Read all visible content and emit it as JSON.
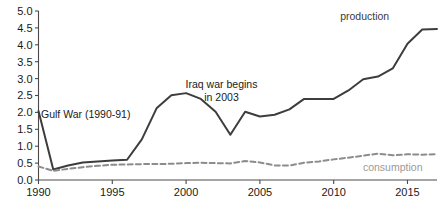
{
  "chart_data": {
    "type": "line",
    "title": "",
    "xlabel": "",
    "ylabel": "",
    "xlim": [
      1990,
      2017
    ],
    "ylim": [
      0.0,
      5.0
    ],
    "grid": false,
    "legend_position": "inline-labels",
    "x": [
      1990,
      1991,
      1992,
      1993,
      1994,
      1995,
      1996,
      1997,
      1998,
      1999,
      2000,
      2001,
      2002,
      2003,
      2004,
      2005,
      2006,
      2007,
      2008,
      2009,
      2010,
      2011,
      2012,
      2013,
      2014,
      2015,
      2016,
      2017
    ],
    "xtick_labels": [
      "1990",
      "1995",
      "2000",
      "2005",
      "2010",
      "2015"
    ],
    "xticks": [
      1990,
      1995,
      2000,
      2005,
      2010,
      2015
    ],
    "ytick_labels": [
      "0.0",
      "0.5",
      "1.0",
      "1.5",
      "2.0",
      "2.5",
      "3.0",
      "3.5",
      "4.0",
      "4.5",
      "5.0"
    ],
    "yticks": [
      0.0,
      0.5,
      1.0,
      1.5,
      2.0,
      2.5,
      3.0,
      3.5,
      4.0,
      4.5,
      5.0
    ],
    "series": [
      {
        "name": "production",
        "style": "solid",
        "color": "#3d3d3d",
        "label_x": 2012.1,
        "label_y": 4.72,
        "values": [
          2.04,
          0.31,
          0.43,
          0.52,
          0.55,
          0.58,
          0.6,
          1.2,
          2.12,
          2.51,
          2.57,
          2.4,
          2.02,
          1.34,
          2.02,
          1.88,
          1.93,
          2.09,
          2.4,
          2.4,
          2.4,
          2.65,
          2.98,
          3.06,
          3.3,
          4.03,
          4.45,
          4.47
        ]
      },
      {
        "name": "consumption",
        "style": "dashed",
        "color": "#8c8c8c",
        "label_x": 2014.0,
        "label_y": 0.28,
        "values": [
          0.4,
          0.27,
          0.33,
          0.38,
          0.42,
          0.45,
          0.46,
          0.47,
          0.47,
          0.48,
          0.5,
          0.51,
          0.5,
          0.49,
          0.56,
          0.52,
          0.43,
          0.43,
          0.51,
          0.55,
          0.61,
          0.66,
          0.72,
          0.78,
          0.73,
          0.76,
          0.75,
          0.76
        ]
      }
    ],
    "annotations": [
      {
        "name": "gulf-war",
        "lines": [
          "Gulf War (1990-91)"
        ],
        "x": 1993.2,
        "y": 1.83
      },
      {
        "name": "iraq-war",
        "lines": [
          "Iraq war begins",
          "in 2003"
        ],
        "x": 2002.4,
        "y": 2.72
      }
    ]
  }
}
